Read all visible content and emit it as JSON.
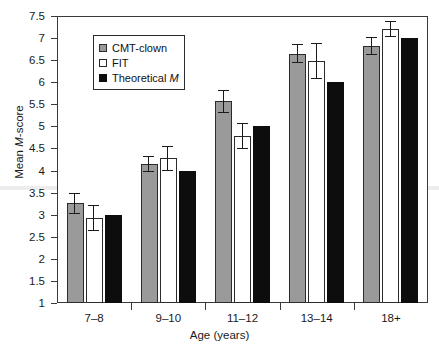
{
  "chart_data": {
    "type": "bar",
    "title": "",
    "xlabel": "Age (years)",
    "ylabel": "Mean M-score",
    "ylabel_parts": {
      "prefix": "Mean ",
      "italic": "M",
      "suffix": "-score"
    },
    "categories": [
      "7–8",
      "9–10",
      "11–12",
      "13–14",
      "18+"
    ],
    "ylim": [
      1,
      7.5
    ],
    "yticks": [
      1,
      1.5,
      2,
      2.5,
      3,
      3.5,
      4,
      4.5,
      5,
      5.5,
      6,
      6.5,
      7,
      7.5
    ],
    "ytick_labels": [
      "1",
      "1.5",
      "2",
      "2.5",
      "3",
      "3.5",
      "4",
      "4.5",
      "5",
      "5.5",
      "6",
      "6.5",
      "7",
      "7.5"
    ],
    "grid": false,
    "legend_position": "upper left inside",
    "series": [
      {
        "name": "CMT-clown",
        "color": "#9a9a9a",
        "values": [
          3.26,
          4.15,
          5.57,
          6.65,
          6.82
        ],
        "errors": [
          0.24,
          0.18,
          0.26,
          0.22,
          0.2
        ]
      },
      {
        "name": "FIT",
        "color": "#ffffff",
        "values": [
          2.92,
          4.28,
          4.78,
          6.48,
          7.2
        ],
        "errors": [
          0.3,
          0.28,
          0.3,
          0.4,
          0.18
        ]
      },
      {
        "name": "Theoretical M",
        "color": "#0d0d0d",
        "values": [
          3.0,
          4.0,
          5.0,
          6.0,
          7.0
        ],
        "errors": [
          0,
          0,
          0,
          0,
          0
        ]
      }
    ]
  },
  "legend": {
    "items": [
      {
        "label": "CMT-clown",
        "italic": ""
      },
      {
        "label": "FIT",
        "italic": ""
      },
      {
        "label": "Theoretical ",
        "italic": "M"
      }
    ]
  }
}
